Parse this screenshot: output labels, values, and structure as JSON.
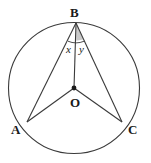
{
  "figure": {
    "stroke_color": "#3a3a3a",
    "fill_color": "#ffffff",
    "shade_color": "#c9c9c9",
    "label_color": "#1a1a1a",
    "circle": {
      "center_x": 74,
      "center_y": 88,
      "radius": 65.5
    },
    "points": [
      {
        "name": "B",
        "label": "B",
        "x": 76,
        "y": 23
      },
      {
        "name": "A",
        "label": "A",
        "x": 27,
        "y": 122
      },
      {
        "name": "C",
        "label": "C",
        "x": 122,
        "y": 122
      },
      {
        "name": "O",
        "label": "O",
        "x": 74,
        "y": 88
      }
    ],
    "segments": [
      {
        "name": "segment-BA",
        "from": "B",
        "to": "A"
      },
      {
        "name": "segment-BO",
        "from": "B",
        "to": "O"
      },
      {
        "name": "segment-BC",
        "from": "B",
        "to": "C"
      },
      {
        "name": "segment-OA",
        "from": "O",
        "to": "A"
      },
      {
        "name": "segment-OC",
        "from": "O",
        "to": "C"
      }
    ],
    "angles": [
      {
        "name": "angle-x",
        "label": "x",
        "vertex": "B",
        "between": [
          "BA",
          "BO"
        ]
      },
      {
        "name": "angle-y",
        "label": "y",
        "vertex": "B",
        "between": [
          "BO",
          "BC"
        ]
      }
    ],
    "shaded_region": {
      "name": "angle-y-shading",
      "vertex": "B",
      "between": [
        "BO",
        "BC"
      ]
    }
  }
}
